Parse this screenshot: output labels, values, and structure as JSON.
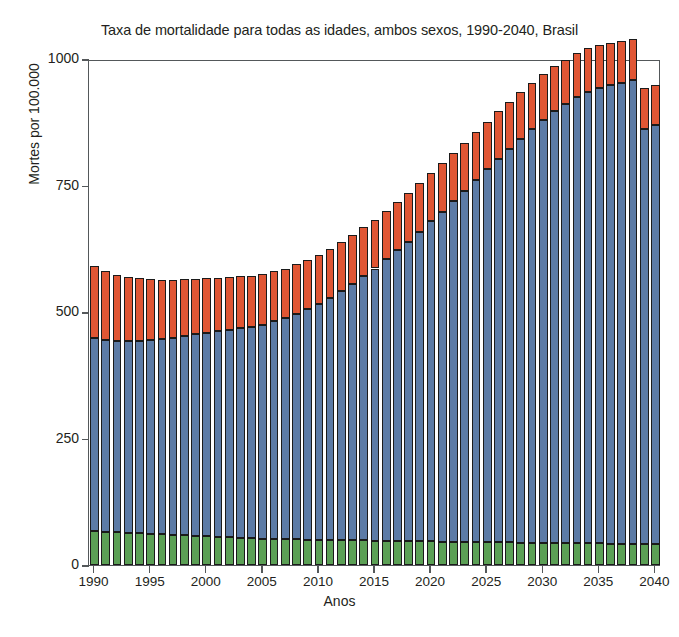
{
  "chart_data": {
    "type": "bar",
    "stacked": true,
    "title": "Taxa de mortalidade para todas as idades, ambos sexos, 1990-2040, Brasil",
    "xlabel": "Anos",
    "ylabel": "Mortes por 100.000",
    "ylim": [
      0,
      1000
    ],
    "yticks": [
      0,
      250,
      500,
      750,
      1000
    ],
    "ytick_labels": [
      "0",
      "250",
      "500",
      "750",
      "1000"
    ],
    "xticks": [
      1990,
      1995,
      2000,
      2005,
      2010,
      2015,
      2020,
      2025,
      2030,
      2035,
      2040
    ],
    "xtick_labels": [
      "1990",
      "1995",
      "2000",
      "2005",
      "2010",
      "2015",
      "2020",
      "2025",
      "2030",
      "2035",
      "2040"
    ],
    "grid": false,
    "legend": null,
    "categories": [
      1990,
      1991,
      1992,
      1993,
      1994,
      1995,
      1996,
      1997,
      1998,
      1999,
      2000,
      2001,
      2002,
      2003,
      2004,
      2005,
      2006,
      2007,
      2008,
      2009,
      2010,
      2011,
      2012,
      2013,
      2014,
      2015,
      2016,
      2017,
      2018,
      2019,
      2020,
      2021,
      2022,
      2023,
      2024,
      2025,
      2026,
      2027,
      2028,
      2029,
      2030,
      2031,
      2032,
      2033,
      2034,
      2035,
      2036,
      2037,
      2038,
      2039,
      2040
    ],
    "series": [
      {
        "name": "segmento-inferior",
        "color": "#5ba055",
        "values": [
          67,
          66,
          65,
          64,
          63,
          62,
          61,
          60,
          59,
          58,
          57,
          56,
          55,
          54,
          53,
          52,
          52,
          51,
          51,
          50,
          50,
          50,
          49,
          49,
          49,
          48,
          48,
          48,
          47,
          47,
          47,
          46,
          46,
          46,
          45,
          45,
          45,
          45,
          44,
          44,
          44,
          44,
          43,
          43,
          43,
          43,
          42,
          42,
          42,
          42,
          41
        ]
      },
      {
        "name": "segmento-medio",
        "color": "#5c7ba6",
        "values": [
          382,
          379,
          377,
          378,
          380,
          382,
          385,
          389,
          393,
          398,
          402,
          406,
          410,
          414,
          418,
          423,
          430,
          437,
          445,
          455,
          466,
          478,
          492,
          507,
          522,
          538,
          556,
          574,
          592,
          612,
          632,
          652,
          673,
          694,
          715,
          737,
          758,
          778,
          798,
          818,
          836,
          853,
          868,
          881,
          892,
          900,
          906,
          911,
          916,
          820,
          828
        ]
      },
      {
        "name": "segmento-superior",
        "color": "#e05634",
        "values": [
          142,
          136,
          131,
          127,
          124,
          121,
          118,
          115,
          113,
          110,
          108,
          106,
          104,
          103,
          101,
          100,
          99,
          98,
          98,
          97,
          97,
          97,
          97,
          97,
          97,
          96,
          96,
          96,
          96,
          96,
          96,
          96,
          95,
          95,
          95,
          94,
          94,
          93,
          92,
          91,
          90,
          89,
          88,
          87,
          86,
          85,
          84,
          83,
          82,
          81,
          80
        ]
      }
    ],
    "totals": [
      591,
      581,
      573,
      569,
      567,
      565,
      564,
      564,
      565,
      566,
      567,
      568,
      569,
      571,
      572,
      575,
      581,
      586,
      594,
      602,
      613,
      625,
      638,
      653,
      668,
      682,
      700,
      718,
      735,
      755,
      775,
      794,
      814,
      835,
      855,
      876,
      897,
      916,
      934,
      953,
      970,
      986,
      999,
      1011,
      1021,
      1028,
      1032,
      1036,
      1040,
      943,
      949
    ]
  }
}
